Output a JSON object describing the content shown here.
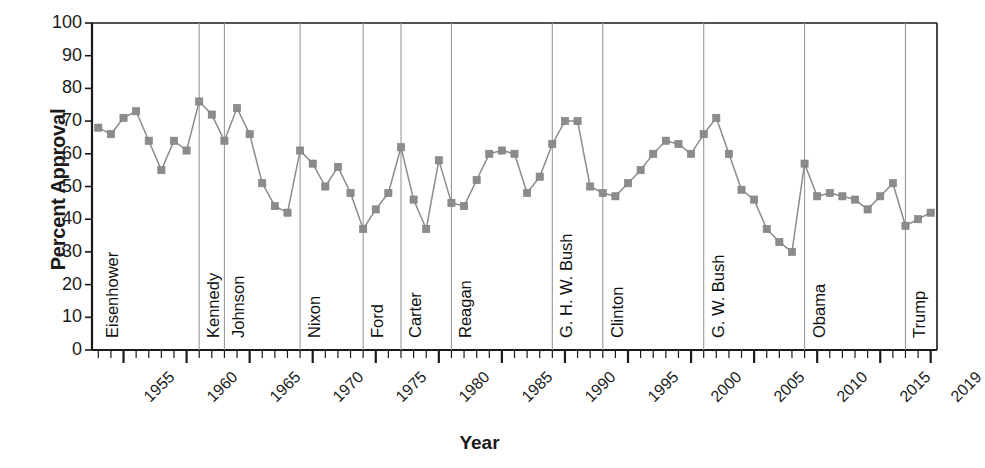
{
  "chart_data": {
    "type": "line",
    "title": "",
    "xlabel": "Year",
    "ylabel": "Percent Approval",
    "xlim": [
      1952.5,
      2019.5
    ],
    "ylim": [
      0,
      100
    ],
    "grid": "vertical-dividers-only",
    "legend": "none",
    "marker": "square",
    "series_color": "#8c8c8c",
    "line_color": "#8c8c8c",
    "y_ticks": [
      0,
      10,
      20,
      30,
      40,
      50,
      60,
      70,
      80,
      90,
      100
    ],
    "x_ticks_major": [
      1955,
      1960,
      1965,
      1970,
      1975,
      1980,
      1985,
      1990,
      1995,
      2000,
      2005,
      2010,
      2015,
      2019
    ],
    "x_tick_interval_minor": 1,
    "series": [
      {
        "name": "Percent Approval",
        "x": [
          1953,
          1954,
          1955,
          1956,
          1957,
          1958,
          1959,
          1960,
          1961,
          1962,
          1963,
          1964,
          1965,
          1966,
          1967,
          1968,
          1969,
          1970,
          1971,
          1972,
          1973,
          1974,
          1975,
          1976,
          1977,
          1978,
          1979,
          1980,
          1981,
          1982,
          1983,
          1984,
          1985,
          1986,
          1987,
          1988,
          1989,
          1990,
          1991,
          1992,
          1993,
          1994,
          1995,
          1996,
          1997,
          1998,
          1999,
          2000,
          2001,
          2002,
          2003,
          2004,
          2005,
          2006,
          2007,
          2008,
          2009,
          2010,
          2011,
          2012,
          2013,
          2014,
          2015,
          2016,
          2017,
          2018,
          2019
        ],
        "values": [
          68,
          66,
          71,
          73,
          64,
          55,
          64,
          61,
          76,
          72,
          64,
          74,
          66,
          51,
          44,
          42,
          61,
          57,
          50,
          56,
          48,
          37,
          43,
          48,
          62,
          46,
          37,
          58,
          45,
          44,
          52,
          60,
          61,
          60,
          48,
          53,
          63,
          70,
          70,
          50,
          48,
          47,
          51,
          55,
          60,
          64,
          63,
          60,
          66,
          71,
          60,
          49,
          46,
          37,
          33,
          30,
          57,
          47,
          48,
          47,
          46,
          43,
          47,
          51,
          38,
          40,
          42
        ]
      }
    ],
    "presidents": [
      {
        "name": "Eisenhower",
        "start": 1953,
        "end": 1961
      },
      {
        "name": "Kennedy",
        "start": 1961,
        "end": 1963
      },
      {
        "name": "Johnson",
        "start": 1963,
        "end": 1969
      },
      {
        "name": "Nixon",
        "start": 1969,
        "end": 1974
      },
      {
        "name": "Ford",
        "start": 1974,
        "end": 1977
      },
      {
        "name": "Carter",
        "start": 1977,
        "end": 1981
      },
      {
        "name": "Reagan",
        "start": 1981,
        "end": 1989
      },
      {
        "name": "G. H. W. Bush",
        "start": 1989,
        "end": 1993
      },
      {
        "name": "Clinton",
        "start": 1993,
        "end": 2001
      },
      {
        "name": "G. W. Bush",
        "start": 2001,
        "end": 2009
      },
      {
        "name": "Obama",
        "start": 2009,
        "end": 2017
      },
      {
        "name": "Trump",
        "start": 2017,
        "end": 2019.5
      }
    ]
  },
  "axes": {
    "y_title": "Percent Approval",
    "x_title": "Year",
    "y_tick_labels": [
      "0",
      "10",
      "20",
      "30",
      "40",
      "50",
      "60",
      "70",
      "80",
      "90",
      "100"
    ],
    "x_tick_labels": [
      "1955",
      "1960",
      "1965",
      "1970",
      "1975",
      "1980",
      "1985",
      "1990",
      "1995",
      "2000",
      "2005",
      "2010",
      "2015",
      "2019"
    ]
  },
  "president_labels": [
    "Eisenhower",
    "Kennedy",
    "Johnson",
    "Nixon",
    "Ford",
    "Carter",
    "Reagan",
    "G. H. W. Bush",
    "Clinton",
    "G. W. Bush",
    "Obama",
    "Trump"
  ],
  "colors": {
    "series": "#8c8c8c",
    "axis": "#1a1a1a",
    "divider": "#9a9a9a",
    "text": "#1a1a1a",
    "background": "#ffffff"
  }
}
